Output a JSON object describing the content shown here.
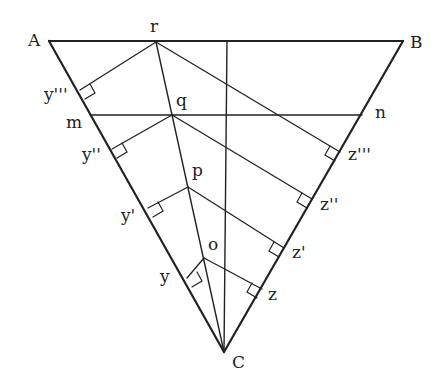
{
  "diagram": {
    "points": {
      "A": {
        "label": "A",
        "x": 49,
        "y": 41
      },
      "B": {
        "label": "B",
        "x": 403,
        "y": 41
      },
      "C": {
        "label": "C",
        "x": 224,
        "y": 352
      },
      "r": {
        "label": "r",
        "x": 156,
        "y": 42
      },
      "q": {
        "label": "q",
        "x": 172,
        "y": 115
      },
      "p": {
        "label": "p",
        "x": 188,
        "y": 187
      },
      "o": {
        "label": "o",
        "x": 204,
        "y": 258
      },
      "m": {
        "label": "m",
        "x": 91,
        "y": 115
      },
      "n": {
        "label": "n",
        "x": 362,
        "y": 115
      },
      "y3": {
        "label": "y'''",
        "x": 80,
        "y": 90
      },
      "y2": {
        "label": "y''",
        "x": 112,
        "y": 149
      },
      "y1": {
        "label": "y'",
        "x": 148,
        "y": 208
      },
      "y0": {
        "label": "y",
        "x": 187,
        "y": 278
      },
      "z3": {
        "label": "z'''",
        "x": 336,
        "y": 159
      },
      "z2": {
        "label": "z''",
        "x": 308,
        "y": 206
      },
      "z1": {
        "label": "z'",
        "x": 280,
        "y": 255
      },
      "z0": {
        "label": "z",
        "x": 260,
        "y": 293
      }
    },
    "labels": {
      "A": "A",
      "B": "B",
      "C": "C",
      "r": "r",
      "q": "q",
      "p": "p",
      "o": "o",
      "m": "m",
      "n": "n",
      "y3": "y'''",
      "y2": "y''",
      "y1": "y'",
      "y0": "y",
      "z3": "z'''",
      "z2": "z''",
      "z1": "z'",
      "z0": "z"
    },
    "line_color": "#222222"
  }
}
